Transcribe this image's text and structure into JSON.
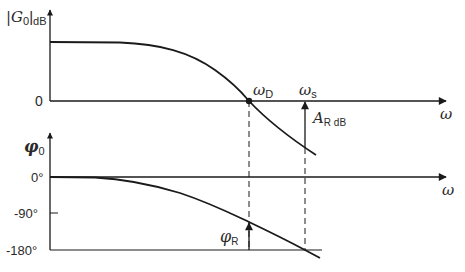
{
  "diagram": {
    "type": "bode-diagram",
    "magnitude_plot": {
      "y_axis_label_main": "|G",
      "y_axis_label_sub": "0",
      "y_axis_label_suffix": "|",
      "y_axis_label_unit": "dB",
      "zero_label": "0",
      "x_axis_label": "ω",
      "crossover_label_main": "ω",
      "crossover_label_sub": "D",
      "stability_freq_label_main": "ω",
      "stability_freq_label_sub": "s",
      "gain_margin_label_main": "A",
      "gain_margin_label_sub": "R dB"
    },
    "phase_plot": {
      "y_axis_label_main": "φ",
      "y_axis_label_sub": "0",
      "x_axis_label": "ω",
      "ticks": [
        "0°",
        "-90°",
        "-180°"
      ],
      "phase_margin_label_main": "φ",
      "phase_margin_label_sub": "R"
    },
    "colors": {
      "line": "#1a1a1a",
      "text": "#2a2a2a",
      "background": "#ffffff"
    }
  }
}
